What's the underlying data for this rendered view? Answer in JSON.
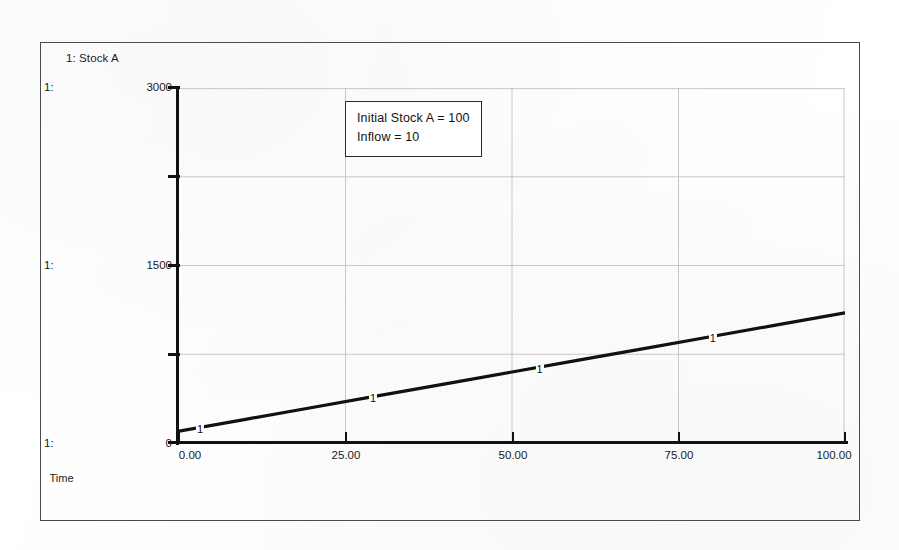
{
  "window": {
    "frame_color": "#4a4a4a",
    "background_color": "#ffffff"
  },
  "legend": {
    "entry": "1: Stock A"
  },
  "scale_index": {
    "top": "1:",
    "middle": "1:",
    "bottom": "1:"
  },
  "annotation": {
    "line1": "Initial Stock A = 100",
    "line2": "Inflow = 10"
  },
  "axis": {
    "x_title": "Time",
    "x_tick_labels": [
      "0.00",
      "25.00",
      "50.00",
      "75.00",
      "100.00"
    ],
    "y_tick_labels": [
      "3000",
      "1500",
      "0"
    ]
  },
  "marker_glyph": {
    "m0": "1",
    "m1": "1",
    "m2": "1",
    "m3": "1"
  },
  "chart_data": {
    "type": "line",
    "title": "",
    "subtitle": "",
    "xlabel": "Time",
    "ylabel": "",
    "xlim": [
      0,
      100
    ],
    "ylim": [
      0,
      3000
    ],
    "xticks": [
      0,
      25,
      50,
      75,
      100
    ],
    "xticklabels": [
      "0.00",
      "25.00",
      "50.00",
      "75.00",
      "100.00"
    ],
    "yticks": [
      0,
      750,
      1500,
      2250,
      3000
    ],
    "yticklabels": [
      "0",
      "",
      "1500",
      "",
      "3000"
    ],
    "grid": true,
    "grid_color": "#b9b9b9",
    "legend": [
      "1: Stock A"
    ],
    "legend_position": "top-left",
    "annotations": [
      "Initial Stock A = 100",
      "Inflow = 10"
    ],
    "line_color": "#111111",
    "line_width": 3.2,
    "series": [
      {
        "name": "Stock A",
        "marker_label": "1",
        "x": [
          0,
          10,
          20,
          30,
          40,
          50,
          60,
          70,
          80,
          90,
          100
        ],
        "values": [
          100,
          200,
          300,
          400,
          500,
          600,
          700,
          800,
          900,
          1000,
          1100
        ],
        "marker_x": [
          0,
          26,
          51,
          77
        ]
      }
    ]
  }
}
